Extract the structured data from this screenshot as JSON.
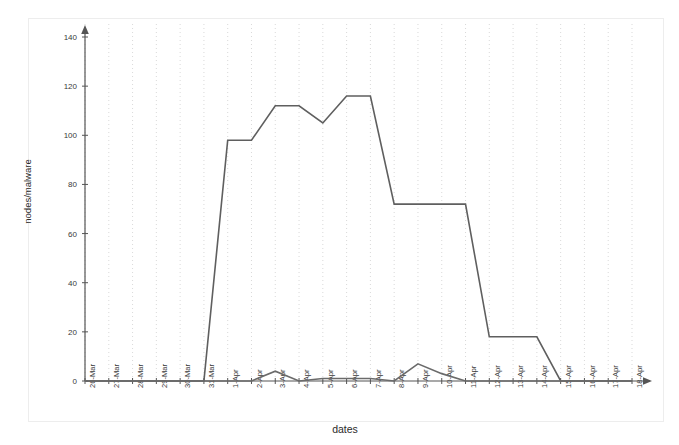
{
  "chart_data": {
    "type": "line",
    "title": "",
    "xlabel": "dates",
    "ylabel": "nodes/malware",
    "categories": [
      "26-Mar",
      "27-Mar",
      "28-Mar",
      "29-Mar",
      "30-Mar",
      "31-Mar",
      "1-Apr",
      "2-Apr",
      "3-Apr",
      "4-Apr",
      "5-Apr",
      "6-Apr",
      "7-Apr",
      "8-Apr",
      "9-Apr",
      "10-Apr",
      "11-Apr",
      "12-Apr",
      "13-Apr",
      "14-Apr",
      "15-Apr",
      "16-Apr",
      "17-Apr",
      "18-Apr"
    ],
    "yticks": [
      0,
      20,
      40,
      60,
      80,
      100,
      120,
      140
    ],
    "ylim": [
      0,
      140
    ],
    "xlim_labels": [
      "26-Mar",
      "18-Apr"
    ],
    "grid": "vertical-dotted",
    "legend": "none",
    "series": [
      {
        "name": "nodes",
        "color": "#5f5f5f",
        "values": [
          0,
          0,
          0,
          0,
          0,
          0,
          98,
          98,
          112,
          112,
          105,
          116,
          116,
          72,
          72,
          72,
          72,
          18,
          18,
          18,
          0,
          0,
          0,
          0
        ]
      },
      {
        "name": "malware",
        "color": "#6b6b6b",
        "values": [
          0,
          0,
          0,
          0,
          0,
          0,
          0,
          0,
          4,
          0,
          1,
          1,
          1,
          0,
          7,
          3,
          0,
          0,
          0,
          0,
          0,
          0,
          0,
          0
        ]
      }
    ]
  },
  "axes": {
    "y_axis_name": "nodes-malware-axis",
    "x_axis_name": "dates-axis"
  }
}
